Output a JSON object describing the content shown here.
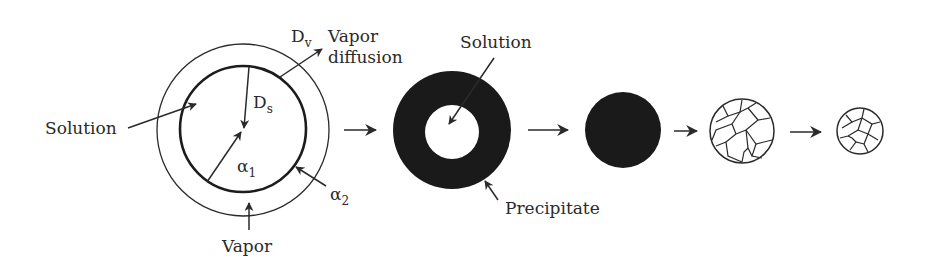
{
  "diagram": {
    "type": "process-flow",
    "stage1": {
      "labels": {
        "Dv_main": "D",
        "Dv_sub": "v",
        "vapor_diffusion_line1": "Vapor",
        "vapor_diffusion_line2": "diffusion",
        "Ds_main": "D",
        "Ds_sub": "s",
        "solution": "Solution",
        "alpha1_main": "α",
        "alpha1_sub": "1",
        "alpha2_main": "α",
        "alpha2_sub": "2",
        "vapor": "Vapor"
      }
    },
    "stage2": {
      "labels": {
        "solution": "Solution",
        "precipitate": "Precipitate"
      }
    },
    "stage3": {
      "name": "solid-particle"
    },
    "stage4": {
      "name": "grain-structured-particle"
    },
    "stage5": {
      "name": "shrunk-grain-particle"
    },
    "colors": {
      "ink": "#2a2a2a",
      "fill_dark": "#1a1a1a",
      "background": "#ffffff"
    }
  }
}
